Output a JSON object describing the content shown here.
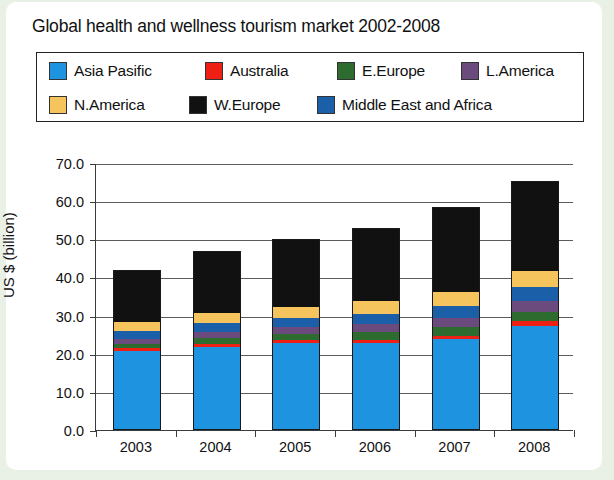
{
  "title": "Global health and wellness tourism market 2002-2008",
  "legend": {
    "rows": [
      [
        {
          "label": "Asia Pasific",
          "color": "#1e93e0",
          "left": 12
        },
        {
          "label": "Australia",
          "color": "#ee2014",
          "left": 168
        },
        {
          "label": "E.Europe",
          "color": "#2d6b2e",
          "left": 300
        },
        {
          "label": "L.America",
          "color": "#6b4a7d",
          "left": 424
        }
      ],
      [
        {
          "label": "N.America",
          "color": "#f5c45c",
          "left": 12
        },
        {
          "label": "W.Europe",
          "color": "#111111",
          "left": 152
        },
        {
          "label": "Middle East and Africa",
          "color": "#1b5fa8",
          "left": 280
        }
      ]
    ]
  },
  "chart_data": {
    "type": "bar",
    "subtype": "stacked-bar",
    "title": "Global health and wellness tourism market 2002-2008",
    "xlabel": "",
    "ylabel": "US $ (billion)",
    "ylim": [
      0.0,
      70.0
    ],
    "ytick_step": 10.0,
    "ytick_labels": [
      "70.0",
      "60.0",
      "50.0",
      "40.0",
      "30.0",
      "20.0",
      "10.0",
      "0.0"
    ],
    "ytick_values": [
      70.0,
      60.0,
      50.0,
      40.0,
      30.0,
      20.0,
      10.0,
      0.0
    ],
    "grid": true,
    "legend_position": "top",
    "categories": [
      "2003",
      "2004",
      "2005",
      "2006",
      "2007",
      "2008"
    ],
    "series": [
      {
        "name": "Asia Pasific",
        "color": "#1e93e0",
        "values": [
          20.5,
          21.5,
          22.5,
          22.5,
          23.5,
          27.0
        ]
      },
      {
        "name": "Australia",
        "color": "#ee2014",
        "values": [
          0.7,
          0.8,
          0.9,
          0.9,
          1.0,
          1.3
        ]
      },
      {
        "name": "E.Europe",
        "color": "#2d6b2e",
        "values": [
          1.1,
          1.5,
          1.6,
          2.0,
          2.2,
          2.5
        ]
      },
      {
        "name": "L.America",
        "color": "#6b4a7d",
        "values": [
          1.4,
          1.7,
          1.8,
          2.2,
          2.4,
          2.7
        ]
      },
      {
        "name": "Middle East and Africa",
        "color": "#1b5fa8",
        "values": [
          2.0,
          2.3,
          2.4,
          2.6,
          3.2,
          3.8
        ]
      },
      {
        "name": "N.America",
        "color": "#f5c45c",
        "values": [
          2.3,
          2.5,
          2.8,
          3.3,
          3.7,
          4.2
        ]
      },
      {
        "name": "W.Europe",
        "color": "#111111",
        "values": [
          13.5,
          16.2,
          17.5,
          19.0,
          22.0,
          23.3
        ]
      }
    ],
    "totals": [
      41.5,
      46.5,
      49.5,
      52.5,
      58.0,
      64.8
    ]
  }
}
